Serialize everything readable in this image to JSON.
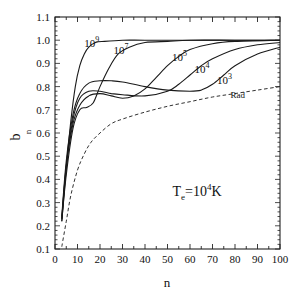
{
  "chart_data": {
    "type": "line",
    "title": "",
    "xlabel": "n",
    "ylabel": "b",
    "ylabel_sub": "n",
    "xlim": [
      0,
      100
    ],
    "ylim": [
      0.1,
      1.1
    ],
    "xticks": [
      0,
      10,
      20,
      30,
      40,
      50,
      60,
      70,
      80,
      90,
      100
    ],
    "yticks": [
      0.1,
      0.2,
      0.3,
      0.4,
      0.5,
      0.6,
      0.7,
      0.8,
      0.9,
      1.0,
      1.1
    ],
    "ytick_labels": [
      "0.1",
      "0.2",
      "0.3",
      "0.4",
      "0.5",
      "0.6",
      "0.7",
      "0.8",
      "0.9",
      "1.0",
      "1.1"
    ],
    "grid": false,
    "annotation": {
      "text_main": "T",
      "text_sub": "e",
      "text_eq": "=10",
      "text_sup": "4",
      "text_unit": "K",
      "x": 70,
      "y": 0.33
    },
    "series": [
      {
        "name": "10^9",
        "label_base": "10",
        "label_exp": "9",
        "style": "solid",
        "label_pos": [
          13,
          0.97
        ],
        "x": [
          3,
          5,
          7,
          9,
          11,
          13,
          15,
          18,
          22,
          30,
          40,
          60,
          100
        ],
        "y": [
          0.22,
          0.45,
          0.65,
          0.8,
          0.89,
          0.94,
          0.97,
          0.99,
          0.995,
          1.0,
          1.0,
          1.0,
          1.0
        ]
      },
      {
        "name": "10^7",
        "label_base": "10",
        "label_exp": "7",
        "style": "solid",
        "label_pos": [
          26,
          0.94
        ],
        "x": [
          3,
          5,
          8,
          11,
          14,
          17,
          20,
          24,
          28,
          33,
          40,
          50,
          60,
          80,
          100
        ],
        "y": [
          0.22,
          0.42,
          0.62,
          0.7,
          0.71,
          0.73,
          0.8,
          0.88,
          0.94,
          0.97,
          0.99,
          0.995,
          1.0,
          1.0,
          1.0
        ]
      },
      {
        "name": "10^5",
        "label_base": "10",
        "label_exp": "5",
        "style": "solid",
        "label_pos": [
          52,
          0.91
        ],
        "x": [
          3,
          5,
          8,
          11,
          15,
          20,
          25,
          30,
          35,
          40,
          45,
          50,
          55,
          60,
          70,
          80,
          100
        ],
        "y": [
          0.23,
          0.45,
          0.64,
          0.72,
          0.76,
          0.77,
          0.76,
          0.75,
          0.76,
          0.79,
          0.84,
          0.89,
          0.93,
          0.96,
          0.985,
          0.995,
          1.0
        ]
      },
      {
        "name": "10^4",
        "label_base": "10",
        "label_exp": "4",
        "style": "solid",
        "label_pos": [
          62,
          0.86
        ],
        "x": [
          3,
          5,
          8,
          11,
          15,
          20,
          25,
          30,
          40,
          50,
          55,
          60,
          65,
          70,
          80,
          90,
          100
        ],
        "y": [
          0.23,
          0.46,
          0.66,
          0.75,
          0.78,
          0.78,
          0.77,
          0.765,
          0.76,
          0.78,
          0.81,
          0.85,
          0.89,
          0.92,
          0.96,
          0.98,
          0.99
        ]
      },
      {
        "name": "10^3",
        "label_base": "10",
        "label_exp": "3",
        "style": "solid",
        "label_pos": [
          72,
          0.81
        ],
        "x": [
          3,
          5,
          8,
          11,
          15,
          20,
          25,
          30,
          40,
          50,
          60,
          65,
          70,
          75,
          80,
          90,
          100
        ],
        "y": [
          0.24,
          0.48,
          0.68,
          0.77,
          0.815,
          0.825,
          0.825,
          0.82,
          0.8,
          0.785,
          0.78,
          0.785,
          0.81,
          0.85,
          0.89,
          0.94,
          0.97
        ]
      },
      {
        "name": "Rad",
        "label_base": "Rad",
        "label_exp": "",
        "style": "dashed",
        "label_pos": [
          78,
          0.75
        ],
        "x": [
          3,
          5,
          7,
          10,
          13,
          16,
          20,
          25,
          30,
          40,
          50,
          60,
          70,
          80,
          90,
          100
        ],
        "y": [
          0.11,
          0.22,
          0.33,
          0.44,
          0.51,
          0.56,
          0.6,
          0.64,
          0.66,
          0.69,
          0.715,
          0.735,
          0.755,
          0.77,
          0.785,
          0.8
        ]
      }
    ]
  }
}
